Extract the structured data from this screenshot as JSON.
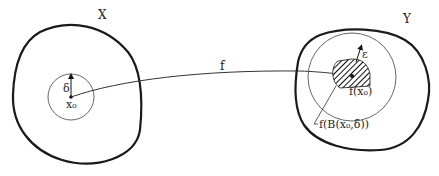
{
  "diagram": {
    "type": "continuity-epsilon-delta",
    "sets": {
      "domain": {
        "label": "X"
      },
      "codomain": {
        "label": "Y"
      }
    },
    "domain_ball": {
      "center_label": "x₀",
      "radius_label": "δ"
    },
    "map": {
      "label": "f"
    },
    "codomain_ball": {
      "radius_label": "ε",
      "center_label": "f(x₀)"
    },
    "image_region": {
      "label": "f(B(x₀,δ))",
      "fill": "hatched"
    },
    "colors": {
      "stroke": "#1a1a1a",
      "circle": "#555555",
      "background": "#ffffff"
    }
  }
}
